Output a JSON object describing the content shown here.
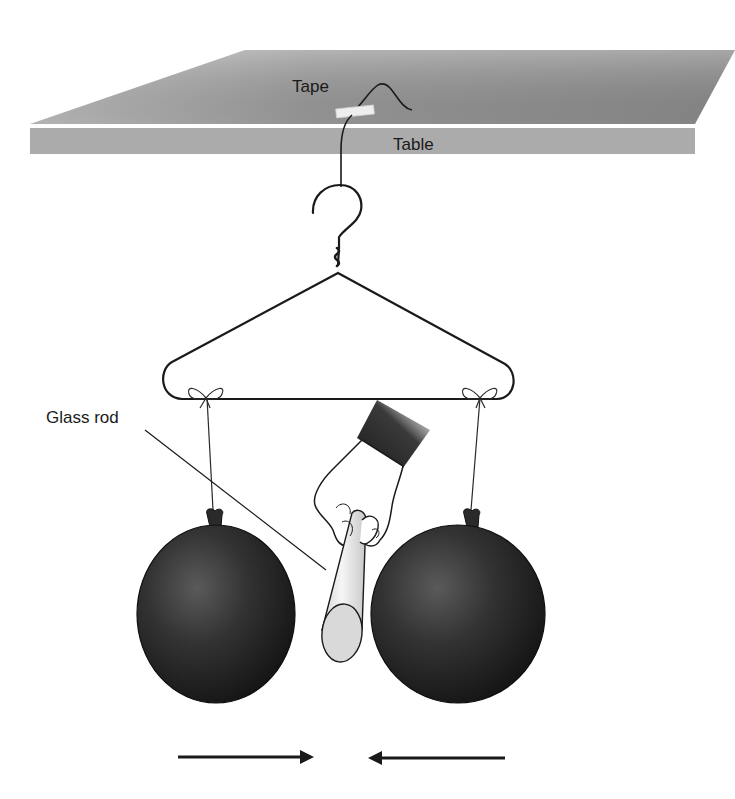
{
  "labels": {
    "tape": "Tape",
    "table": "Table",
    "glass_rod": "Glass rod"
  },
  "objects": {
    "table": {
      "top_color": "#8c8c8c",
      "edge_color": "#a6a6a6"
    },
    "hanger": {
      "color": "#1a1a1a"
    },
    "balloons": {
      "count": 2,
      "color": "#1e1e1e"
    },
    "glass_rod": {
      "color": "#d9d9d9"
    },
    "arrows": [
      {
        "direction": "right"
      },
      {
        "direction": "left"
      }
    ]
  }
}
